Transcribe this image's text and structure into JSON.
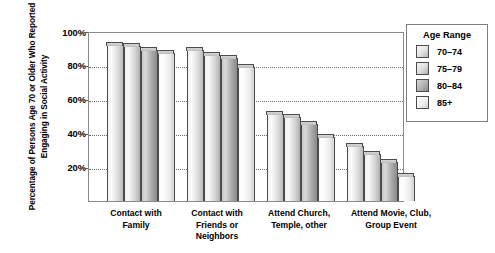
{
  "chart_data": {
    "type": "bar",
    "title": "",
    "xlabel": "",
    "ylabel": "Percentage of Persons Age 70 or Older Who Reported Engaging in Social Activity",
    "ylim": [
      0,
      100
    ],
    "yticks": [
      "20%",
      "40%",
      "60%",
      "80%",
      "100%"
    ],
    "ytick_values": [
      20,
      40,
      60,
      80,
      100
    ],
    "grid": "horizontal-dotted",
    "legend_position": "right",
    "legend_title": "Age Range",
    "categories": [
      "Contact with Family",
      "Contact with Friends or Neighbors",
      "Attend Church, Temple, other",
      "Attend Movie, Club, Group Event"
    ],
    "series": [
      {
        "name": "70–74",
        "values": [
          93,
          90,
          52,
          33
        ]
      },
      {
        "name": "75–79",
        "values": [
          92,
          87,
          50,
          28
        ]
      },
      {
        "name": "80–84",
        "values": [
          90,
          85,
          46,
          23
        ]
      },
      {
        "name": "85+",
        "values": [
          88,
          80,
          38,
          15
        ]
      }
    ]
  },
  "axis": {
    "y_title": "Percentage of Persons Age 70 or Older Who Reported Engaging in Social Activity",
    "ticks": [
      {
        "label": "100%",
        "value": 100
      },
      {
        "label": "80%",
        "value": 80
      },
      {
        "label": "60%",
        "value": 60
      },
      {
        "label": "40%",
        "value": 40
      },
      {
        "label": "20%",
        "value": 20
      }
    ]
  },
  "categories": [
    {
      "line1": "Contact with",
      "line2": "Family",
      "line3": ""
    },
    {
      "line1": "Contact with",
      "line2": "Friends or",
      "line3": "Neighbors"
    },
    {
      "line1": "Attend Church,",
      "line2": "Temple, other",
      "line3": ""
    },
    {
      "line1": "Attend Movie, Club,",
      "line2": "Group Event",
      "line3": ""
    }
  ],
  "legend": {
    "title": "Age Range",
    "items": [
      {
        "label": "70–74"
      },
      {
        "label": "75–79"
      },
      {
        "label": "80–84"
      },
      {
        "label": "85+"
      }
    ]
  },
  "colors": {
    "frame": "#8a8a8a",
    "gridline": "#6d6d6d",
    "bar_outline": "#4c4c4c",
    "bar_series_1": "#e2e2e2",
    "bar_series_2": "#dcdcdc",
    "bar_series_3": "#b2b2b2",
    "bar_series_4": "#f0f0f0",
    "text": "#000000",
    "background": "#ffffff"
  }
}
